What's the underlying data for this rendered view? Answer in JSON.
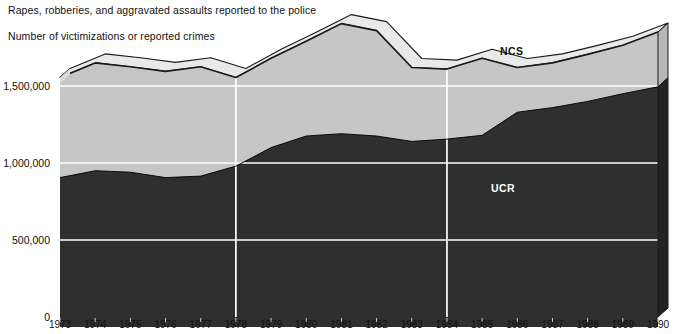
{
  "chart_title": "Rapes, robberies, and aggravated assaults reported to the police",
  "chart_subtitle": "Number of victimizations or reported crimes",
  "labels": {
    "ncs_tag": "NCS",
    "ucr_tag": "UCR"
  },
  "colors": {
    "ncs_fill": "#c6c6c6",
    "ucr_fill": "#2f2f2f",
    "outline": "#1a1a1a",
    "gridline": "#ffffff",
    "background": "#ffffff",
    "text": "#111111",
    "ucr_tag_text": "#ffffff"
  },
  "chart_data": {
    "type": "area",
    "title": "Rapes, robberies, and aggravated assaults reported to the police",
    "subtitle": "Number of victimizations or reported crimes",
    "xlabel": "",
    "ylabel": "Number of victimizations or reported crimes",
    "ylim": [
      0,
      2000000
    ],
    "yticks": [
      0,
      500000,
      1000000,
      1500000
    ],
    "ytick_labels": [
      "0",
      "500,000",
      "1,000,000",
      "1,500,000"
    ],
    "grid": true,
    "vertical_gridlines_at": [
      1978,
      1984
    ],
    "legend": "inline-annotations",
    "stacked": false,
    "x": [
      1973,
      1974,
      1975,
      1976,
      1977,
      1978,
      1979,
      1980,
      1981,
      1982,
      1983,
      1984,
      1985,
      1986,
      1987,
      1988,
      1989,
      1990
    ],
    "xtick_labels": [
      "1973",
      "1974",
      "1975",
      "1976",
      "1977",
      "1978",
      "1979",
      "1980",
      "1981",
      "1982",
      "1983",
      "1984",
      "1985",
      "1986",
      "1987",
      "1988",
      "1989",
      "1990"
    ],
    "series": [
      {
        "name": "NCS",
        "description": "National Crime Survey victimizations",
        "fill": "#c6c6c6",
        "values": [
          1555000,
          1650000,
          1625000,
          1595000,
          1625000,
          1555000,
          1680000,
          1790000,
          1905000,
          1860000,
          1620000,
          1610000,
          1680000,
          1620000,
          1650000,
          1705000,
          1765000,
          1850000
        ]
      },
      {
        "name": "UCR",
        "description": "Uniform Crime Reports crimes reported to police",
        "fill": "#2f2f2f",
        "values": [
          905000,
          950000,
          940000,
          905000,
          915000,
          980000,
          1100000,
          1175000,
          1190000,
          1175000,
          1140000,
          1155000,
          1180000,
          1330000,
          1360000,
          1400000,
          1450000,
          1495000
        ]
      }
    ],
    "annotations": [
      {
        "text": "NCS",
        "x": 1986,
        "y": 1790000
      },
      {
        "text": "UCR",
        "x": 1986,
        "y": 660000
      }
    ]
  }
}
